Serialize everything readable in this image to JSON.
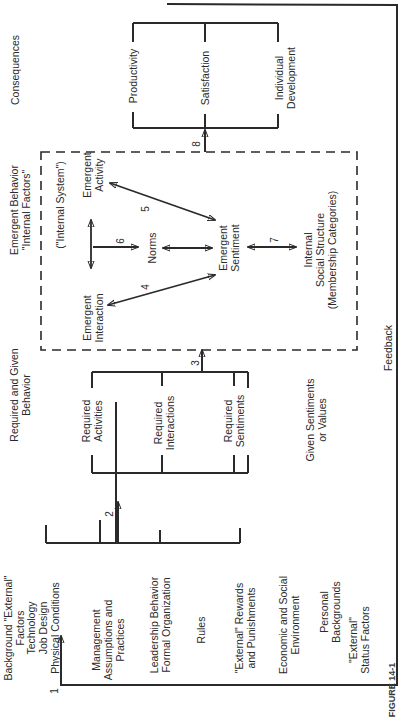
{
  "figure": {
    "orientation": "rotated -90deg (reads bottom-to-top)",
    "caption_partial": "FIGURE 14-1"
  },
  "columns": {
    "background": {
      "heading": [
        "Background \"External\"",
        "Factors"
      ],
      "items": [
        [
          "Technology",
          "Job Design",
          "Physical Conditions"
        ],
        [
          "Management",
          "Assumptions and",
          "Practices"
        ],
        [
          "Leadership Behavior",
          "Formal Organization"
        ],
        [
          "Rules"
        ],
        [
          "\"External\" Rewards",
          "and Punishments"
        ],
        [
          "Economic and Social",
          "Environment"
        ],
        [
          "Personal",
          "Backgrounds"
        ],
        [
          "\"External\"",
          "Status Factors"
        ]
      ]
    },
    "required": {
      "heading": [
        "Required and Given",
        "Behavior"
      ],
      "items": [
        [
          "Required",
          "Activities"
        ],
        [
          "Required",
          "Interactions"
        ],
        [
          "Required",
          "Sentiments"
        ],
        [
          "Given Sentiments",
          "or Values"
        ]
      ]
    },
    "emergent": {
      "heading": [
        "Emergent Behavior",
        "\"Internal Factors\""
      ],
      "system_label": "(\"Internal System\")",
      "nodes": {
        "interaction": [
          "Emergent",
          "Interaction"
        ],
        "activity": [
          "Emergent",
          "Activity"
        ],
        "norms": [
          "Norms"
        ],
        "sentiment": [
          "Emergent",
          "Sentiment"
        ],
        "structure": [
          "Internal",
          "Social Structure",
          "(Membership Categories)"
        ]
      }
    },
    "consequences": {
      "heading": [
        "Consequences"
      ],
      "items": [
        [
          "Productivity"
        ],
        [
          "Satisfaction"
        ],
        [
          "Individual",
          "Development"
        ]
      ]
    }
  },
  "arrows": {
    "feedback_label": "Feedback",
    "numbers": [
      "1",
      "2",
      "3",
      "4",
      "5",
      "6",
      "7",
      "8"
    ]
  }
}
